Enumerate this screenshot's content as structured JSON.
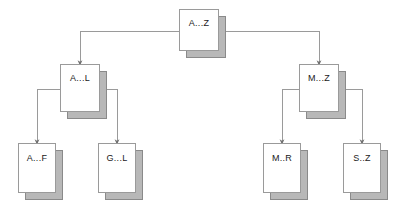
{
  "diagram": {
    "background_color": "#ffffff",
    "node_fill_color": "#ffffff",
    "node_border_color": "#9a9a9a",
    "node_shadow_color": "#b8b8b8",
    "edge_color": "#9a9a9a",
    "label_color": "#1a1a1a",
    "nodes": [
      {
        "id": "root",
        "label": "A...Z",
        "level": 0,
        "x": 179,
        "y": 9,
        "w": 40,
        "h": 42
      },
      {
        "id": "al",
        "label": "A...L",
        "level": 1,
        "x": 60,
        "y": 64,
        "w": 40,
        "h": 48
      },
      {
        "id": "mz",
        "label": "M...Z",
        "level": 1,
        "x": 299,
        "y": 64,
        "w": 40,
        "h": 48
      },
      {
        "id": "af",
        "label": "A...F",
        "level": 2,
        "x": 18,
        "y": 143,
        "w": 38,
        "h": 50
      },
      {
        "id": "gl",
        "label": "G...L",
        "level": 2,
        "x": 98,
        "y": 143,
        "w": 38,
        "h": 50
      },
      {
        "id": "mr",
        "label": "M..R",
        "level": 2,
        "x": 263,
        "y": 143,
        "w": 38,
        "h": 50
      },
      {
        "id": "sz",
        "label": "S..Z",
        "level": 2,
        "x": 343,
        "y": 143,
        "w": 38,
        "h": 50
      }
    ],
    "edges": [
      {
        "from": "root",
        "to": "al",
        "from_side": "left",
        "to_side": "top"
      },
      {
        "from": "root",
        "to": "mz",
        "from_side": "right",
        "to_side": "top"
      },
      {
        "from": "al",
        "to": "af",
        "from_side": "left",
        "to_side": "top"
      },
      {
        "from": "al",
        "to": "gl",
        "from_side": "right",
        "to_side": "top"
      },
      {
        "from": "mz",
        "to": "mr",
        "from_side": "left",
        "to_side": "top"
      },
      {
        "from": "mz",
        "to": "sz",
        "from_side": "right",
        "to_side": "top"
      }
    ]
  }
}
